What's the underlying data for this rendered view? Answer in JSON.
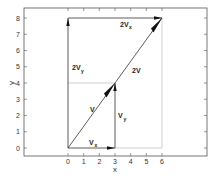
{
  "figure": {
    "xlabel": "x",
    "ylabel": "y",
    "xticks": [
      "0",
      "1",
      "2",
      "3",
      "4",
      "5",
      "6"
    ],
    "yticks": [
      "0",
      "1",
      "2",
      "3",
      "4",
      "5",
      "6",
      "7",
      "8"
    ],
    "colors": {
      "frame": "#555555",
      "vector": "#333333",
      "guide": "#bbbbbb",
      "arrowhead": "#111111"
    }
  },
  "vectors": {
    "v": {
      "label": "V",
      "from": [
        0,
        0
      ],
      "to": [
        3,
        4
      ]
    },
    "two_v": {
      "label": "2V",
      "from": [
        0,
        0
      ],
      "to": [
        6,
        8
      ]
    },
    "vx": {
      "label": "V",
      "sub": "x",
      "from": [
        0,
        0
      ],
      "to": [
        3,
        0
      ]
    },
    "vy": {
      "label": "V",
      "sub": "y",
      "from": [
        3,
        0
      ],
      "to": [
        3,
        4
      ]
    },
    "two_vx": {
      "label": "2V",
      "sub": "x",
      "from": [
        0,
        8
      ],
      "to": [
        6,
        8
      ]
    },
    "two_vy": {
      "label": "2V",
      "sub": "y",
      "from": [
        0,
        0
      ],
      "to": [
        0,
        8
      ]
    }
  }
}
